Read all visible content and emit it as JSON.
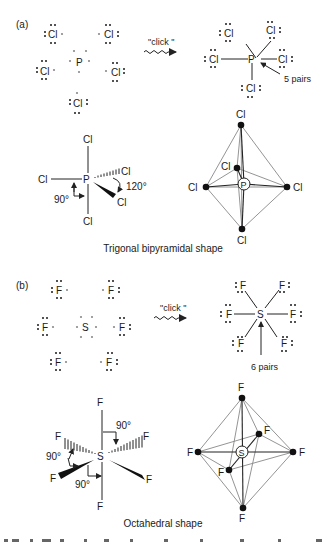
{
  "panel_a": {
    "label": "(a)",
    "lewis_left": {
      "center": "P",
      "ligands": [
        "Cl",
        "Cl",
        "Cl",
        "Cl",
        "Cl"
      ]
    },
    "arrow_text": "\"click \"",
    "lewis_right": {
      "center": "P",
      "ligands": [
        "Cl",
        "Cl",
        "Cl",
        "Cl",
        "Cl"
      ],
      "annotation": "5 pairs"
    },
    "wedge_structure": {
      "center": "P",
      "top": "Cl",
      "bottom": "Cl",
      "left": "Cl",
      "hashed": "Cl",
      "wedge": "Cl",
      "angle_axial": "90°",
      "angle_equatorial": "120°"
    },
    "polyhedron": {
      "center": "P",
      "top": "Cl",
      "bottom": "Cl",
      "left": "Cl",
      "right": "Cl",
      "back": "Cl"
    },
    "caption": "Trigonal bipyramidal shape"
  },
  "panel_b": {
    "label": "(b)",
    "lewis_left": {
      "center": "S",
      "ligands": [
        "F",
        "F",
        "F",
        "F",
        "F",
        "F"
      ]
    },
    "arrow_text": "\"click \"",
    "lewis_right": {
      "center": "S",
      "ligands": [
        "F",
        "F",
        "F",
        "F",
        "F",
        "F"
      ],
      "annotation": "6 pairs"
    },
    "wedge_structure": {
      "center": "S",
      "top": "F",
      "bottom": "F",
      "hashed_left": "F",
      "hashed_right": "F",
      "wedge_left": "F",
      "wedge_right": "F",
      "angle_top": "90°",
      "angle_left": "90°",
      "angle_bottom": "90°"
    },
    "polyhedron": {
      "center": "S",
      "top": "F",
      "bottom": "F",
      "left": "F",
      "right": "F",
      "front": "F",
      "back": "F"
    },
    "caption": "Octahedral shape"
  }
}
